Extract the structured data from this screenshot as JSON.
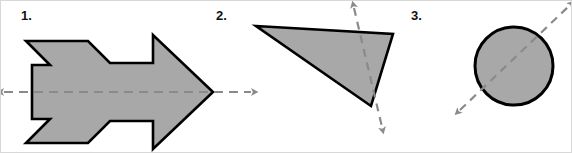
{
  "figure": {
    "width": 572,
    "height": 153,
    "background_color": "#ffffff",
    "border_color": "#d8d8d8",
    "shape_fill_color": "#a8a8a8",
    "shape_stroke_color": "#000000",
    "axis_line_color": "#8a8a8a",
    "caption_note": "Three shaded shapes, each drawn with a dashed double-headed arrow marking a line of symmetry."
  },
  "items": [
    {
      "number": "1.",
      "icon_name": "rocket-arrow-shape",
      "shape_type": "arrow",
      "fill": "#a8a8a8",
      "stroke": "#000000",
      "axis": {
        "name": "horizontal-symmetry-axis",
        "orientation": "horizontal",
        "style": "dashed double-headed arrow",
        "color": "#8a8a8a",
        "from": [
          3,
          91
        ],
        "to": [
          250,
          91
        ]
      },
      "outline_points": "25,40 87,40 109,62 152,62 152,34 212,91 152,148 152,120 109,120 87,142 25,142 49,118 31,118 31,64 49,64"
    },
    {
      "number": "2.",
      "icon_name": "triangle-shape",
      "shape_type": "triangle",
      "fill": "#a8a8a8",
      "stroke": "#000000",
      "axis": {
        "name": "diagonal-symmetry-axis",
        "orientation": "diagonal",
        "style": "dashed double-headed arrow",
        "color": "#8a8a8a",
        "from": [
          353,
          7
        ],
        "to": [
          381,
          126
        ]
      },
      "outline_points": "255,25 392,33 370,105"
    },
    {
      "number": "3.",
      "icon_name": "circle-shape",
      "shape_type": "circle",
      "fill": "#a8a8a8",
      "stroke": "#000000",
      "axis": {
        "name": "diagonal-symmetry-axis",
        "orientation": "diagonal",
        "style": "dashed double-headed arrow",
        "color": "#8a8a8a",
        "from": [
          459,
          109
        ],
        "to": [
          568,
          5
        ]
      },
      "circle": {
        "cx": 513,
        "cy": 65,
        "r": 39
      }
    }
  ]
}
